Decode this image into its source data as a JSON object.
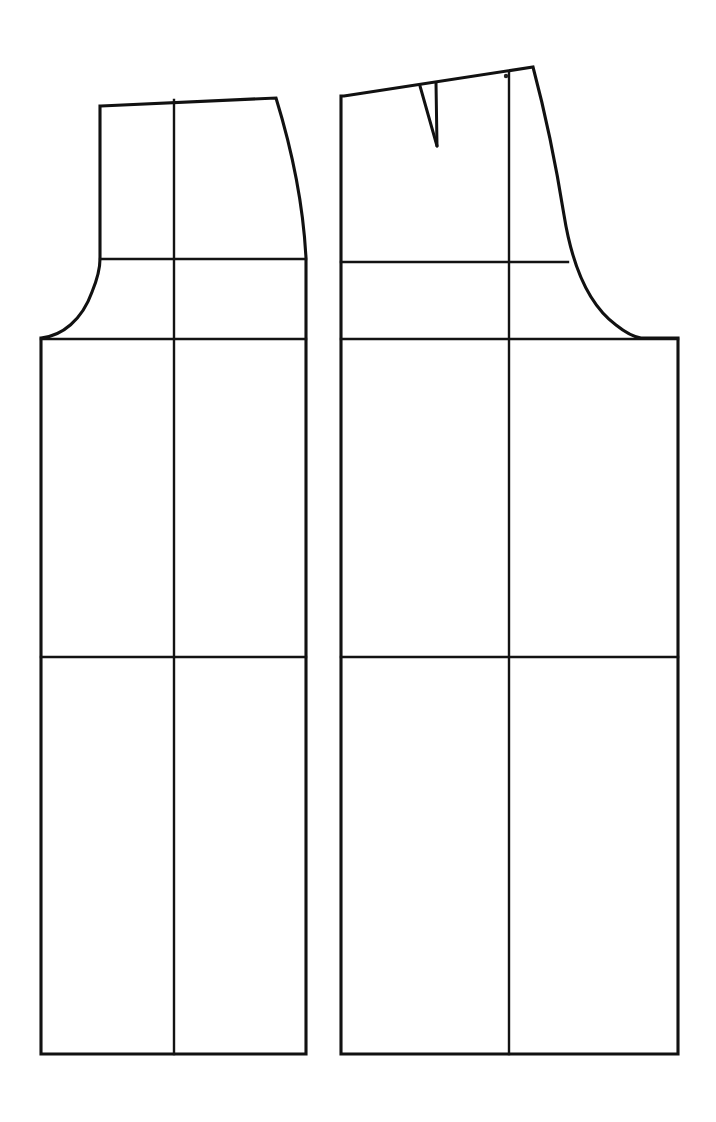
{
  "document": {
    "kind": "sewing-pattern-draft",
    "background_color": "#ffffff",
    "line_color": "#111111",
    "width": 716,
    "height": 1122
  },
  "pieces": [
    {
      "id": "front-bodice-block",
      "label": "front-bodice-block",
      "side": "left",
      "outline_path": "M 101 106 L 276 98 C 292 150 303 200 306 258 L 306 340 L 306 1054 L 41 1054 L 41 338 C 62 336 82 320 92 292 C 99 275 100 266 100 259 L 100 106 Z",
      "construction_lines": [
        {
          "name": "center-vertical-line",
          "path": "M 174 100 L 174 1054"
        },
        {
          "name": "chest-level-line",
          "path": "M 100 259 L 306 259"
        },
        {
          "name": "bust-level-line",
          "path": "M 41 339 L 306 339"
        },
        {
          "name": "hip-level-line",
          "path": "M 41 657 L 306 657"
        }
      ]
    },
    {
      "id": "back-bodice-block",
      "label": "back-bodice-block",
      "side": "right",
      "outline_path": "M 344 96 L 533 67 C 545 112 556 165 564 215 C 572 265 589 305 616 325 C 626 333 634 337 641 338 L 678 338 L 678 1054 L 341 1054 L 341 339 L 341 96 Z",
      "construction_lines": [
        {
          "name": "center-vertical-line",
          "path": "M 509 72 L 509 1054"
        },
        {
          "name": "shoulder-level-line",
          "path": "M 341 262 L 568 262"
        },
        {
          "name": "bust-level-line",
          "path": "M 341 339 L 678 339"
        },
        {
          "name": "hip-level-line",
          "path": "M 341 657 L 678 657"
        }
      ],
      "dart": {
        "name": "shoulder-dart",
        "left_leg_path": "M 420 86 L 437 146",
        "right_leg_path": "M 436 83 L 437 146",
        "apex_x": 437,
        "apex_y": 146
      },
      "marks": [
        {
          "name": "balance-dot",
          "cx": 506,
          "cy": 76,
          "r": 2.2
        }
      ]
    }
  ]
}
